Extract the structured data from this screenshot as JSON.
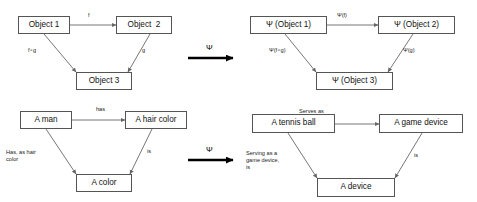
{
  "figure": {
    "type": "commutative-diagram",
    "functor_symbol": "Ψ",
    "edge_arrow_color": "#666666",
    "functor_arrow_color": "#000000",
    "box_border_color": "#555555"
  },
  "panels": {
    "top_left": {
      "name": "abstract-source-category",
      "nodes": {
        "a": "Object 1",
        "b": "Object  2",
        "c": "Object 3"
      },
      "edges": {
        "ab": "f",
        "ac": "f∘g",
        "bc": "g"
      }
    },
    "top_right": {
      "name": "abstract-target-category",
      "nodes": {
        "a": "Ψ (Object 1)",
        "b": "Ψ (Object 2)",
        "c": "Ψ (Object 3)"
      },
      "edges": {
        "ab": "Ψ(f)",
        "ac": "Ψ(f∘g)",
        "bc": "Ψ(g)"
      }
    },
    "bottom_left": {
      "name": "concrete-source-category",
      "nodes": {
        "a": "A man",
        "b": "A hair color",
        "c": "A color"
      },
      "edges": {
        "ab": "has",
        "ac": "Has, as hair\ncolor",
        "bc": "is"
      }
    },
    "bottom_right": {
      "name": "concrete-target-category",
      "nodes": {
        "a": "A tennis ball",
        "b": "A game device",
        "c": "A device"
      },
      "edges": {
        "ab": "Serves as",
        "ac": "Serving as a\ngame device,\nis",
        "bc": "is"
      }
    }
  },
  "functor_arrows": {
    "top": "Ψ",
    "bottom": "Ψ"
  }
}
